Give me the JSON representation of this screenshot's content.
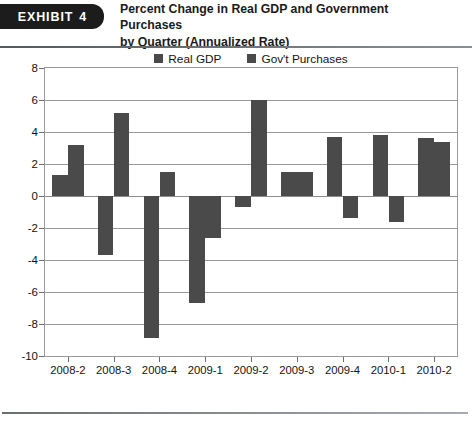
{
  "header": {
    "exhibit_tag_label": "EXHIBIT",
    "exhibit_number": "4",
    "title_line_1": "Percent Change in Real GDP and Government Purchases",
    "title_line_2": "by Quarter (Annualized Rate)"
  },
  "chart_data": {
    "type": "bar",
    "title": "Percent Change in Real GDP and Government Purchases by Quarter (Annualized Rate)",
    "xlabel": "",
    "ylabel": "",
    "ylim": [
      -10,
      8
    ],
    "ytick_step": 2,
    "yticks": [
      "8",
      "6",
      "4",
      "2",
      "0",
      "-2",
      "-4",
      "-6",
      "-8",
      "-10"
    ],
    "ytick_values": [
      8,
      6,
      4,
      2,
      0,
      -2,
      -4,
      -6,
      -8,
      -10
    ],
    "grid": true,
    "legend_position": "top-center",
    "categories": [
      "2008-2",
      "2008-3",
      "2008-4",
      "2009-1",
      "2009-2",
      "2009-3",
      "2009-4",
      "2010-1",
      "2010-2"
    ],
    "series": [
      {
        "name": "Real GDP",
        "color": "#4a4a4a",
        "values": [
          1.3,
          -3.7,
          -8.9,
          -6.7,
          -0.7,
          1.5,
          3.7,
          3.8,
          3.6
        ]
      },
      {
        "name": "Gov't Purchases",
        "color": "#4a4a4a",
        "values": [
          3.2,
          5.2,
          1.5,
          -2.6,
          6.0,
          1.5,
          -1.4,
          -1.6,
          3.4
        ]
      }
    ]
  },
  "colors": {
    "bar": "#4a4a4a",
    "grid": "#9a9a9a",
    "text": "#141414",
    "tag_background": "#1c1c1c",
    "tag_text": "#ffffff"
  }
}
